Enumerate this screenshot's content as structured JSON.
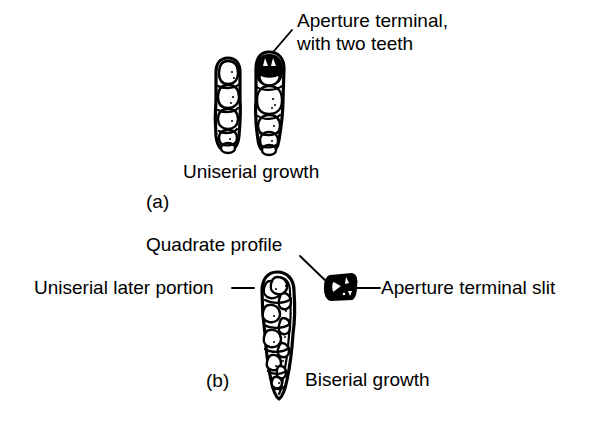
{
  "figure": {
    "background_color": "#ffffff",
    "ink_color": "#000000",
    "panels": [
      {
        "id": "a",
        "letter": "(a)",
        "caption": "Uniserial growth",
        "annotations": [
          {
            "id": "aperture-terminal-two-teeth",
            "text_line_1": "Aperture terminal,",
            "text_line_2": "with two teeth"
          }
        ],
        "specimens": [
          {
            "id": "uniserial-left",
            "description": "uniserial test, elongate, stacked chambers"
          },
          {
            "id": "uniserial-right",
            "description": "uniserial test with dark terminal chamber bearing two teeth"
          }
        ]
      },
      {
        "id": "b",
        "letter": "(b)",
        "caption": "Biserial growth",
        "annotations": [
          {
            "id": "quadrate-profile",
            "text": "Quadrate profile"
          },
          {
            "id": "uniserial-later-portion",
            "text": "Uniserial later portion"
          },
          {
            "id": "aperture-terminal-slit",
            "text": "Aperture terminal slit"
          }
        ],
        "specimens": [
          {
            "id": "biserial-test",
            "description": "biserial test, elongate, tapering base, alternating chambers"
          },
          {
            "id": "quadrate-section",
            "description": "quadrate cross-section with terminal slit aperture"
          }
        ]
      }
    ]
  }
}
